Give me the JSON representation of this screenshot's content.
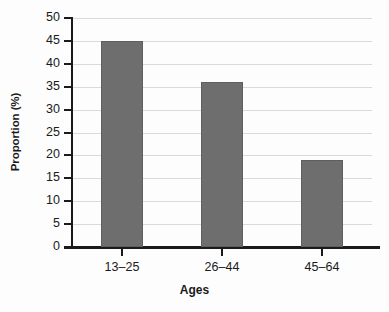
{
  "chart_data": {
    "type": "bar",
    "title": "",
    "categories": [
      "13–25",
      "26–44",
      "45–64"
    ],
    "values": [
      45,
      36,
      19
    ],
    "xlabel": "Ages",
    "ylabel": "Proportion (%)",
    "ylim": [
      0,
      50
    ],
    "ytick_labels": [
      "50",
      "45",
      "40",
      "35",
      "30",
      "25",
      "20",
      "15",
      "10",
      "5",
      "0"
    ],
    "ytick_values": [
      50,
      45,
      40,
      35,
      30,
      25,
      20,
      15,
      10,
      5,
      0
    ],
    "ytick_step": 5,
    "grid": true,
    "grid_axis": "y",
    "legend": false,
    "legend_position": "none",
    "series": [
      {
        "name": "Proportion (%)",
        "values": [
          45,
          36,
          19
        ]
      }
    ]
  },
  "colors": {
    "bar_fill": "#6e6e6e",
    "bar_stroke": "#5f5f5f",
    "gridline": "#dadada",
    "axis": "#1a1a1a",
    "background": "#fdfdfd",
    "text": "#1a1a1a"
  }
}
